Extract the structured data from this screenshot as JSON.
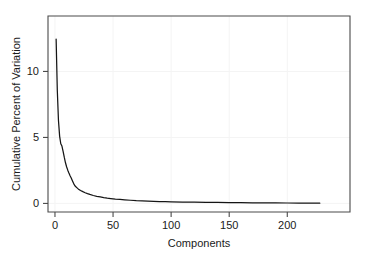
{
  "chart_data": {
    "type": "line",
    "title": "",
    "xlabel": "Components",
    "ylabel": "Cumulative Percent of Variation",
    "xlim": [
      -6,
      254
    ],
    "ylim": [
      -0.65,
      14.2
    ],
    "xticks": [
      0,
      50,
      100,
      150,
      200
    ],
    "yticks": [
      0,
      5,
      10
    ],
    "xticklabels": [
      "0",
      "50",
      "100",
      "150",
      "200"
    ],
    "yticklabels": [
      "0",
      "5",
      "10"
    ],
    "grid": false,
    "legend": null,
    "series": [
      {
        "name": "percent of variation",
        "x": [
          1,
          2,
          3,
          4,
          5,
          6,
          7,
          8,
          9,
          10,
          11,
          12,
          13,
          14,
          15,
          16,
          17,
          18,
          19,
          20,
          22,
          24,
          26,
          28,
          30,
          33,
          36,
          39,
          42,
          45,
          48,
          52,
          56,
          60,
          65,
          70,
          75,
          80,
          85,
          90,
          95,
          100,
          110,
          120,
          130,
          140,
          150,
          160,
          170,
          180,
          190,
          200,
          210,
          220,
          228
        ],
        "values": [
          12.45,
          8.6,
          6.3,
          5.1,
          4.52,
          4.35,
          3.95,
          3.5,
          3.1,
          2.78,
          2.52,
          2.3,
          2.1,
          1.92,
          1.72,
          1.52,
          1.36,
          1.26,
          1.18,
          1.1,
          0.98,
          0.89,
          0.81,
          0.74,
          0.68,
          0.6,
          0.54,
          0.49,
          0.44,
          0.4,
          0.37,
          0.33,
          0.3,
          0.27,
          0.24,
          0.21,
          0.19,
          0.17,
          0.155,
          0.14,
          0.13,
          0.12,
          0.105,
          0.092,
          0.081,
          0.072,
          0.064,
          0.057,
          0.05,
          0.044,
          0.038,
          0.032,
          0.026,
          0.019,
          0.014
        ]
      }
    ]
  },
  "colors": {
    "curve": "#151515",
    "axis": "#4a4a4a",
    "text": "#1a1a1a",
    "background": "#ffffff"
  }
}
